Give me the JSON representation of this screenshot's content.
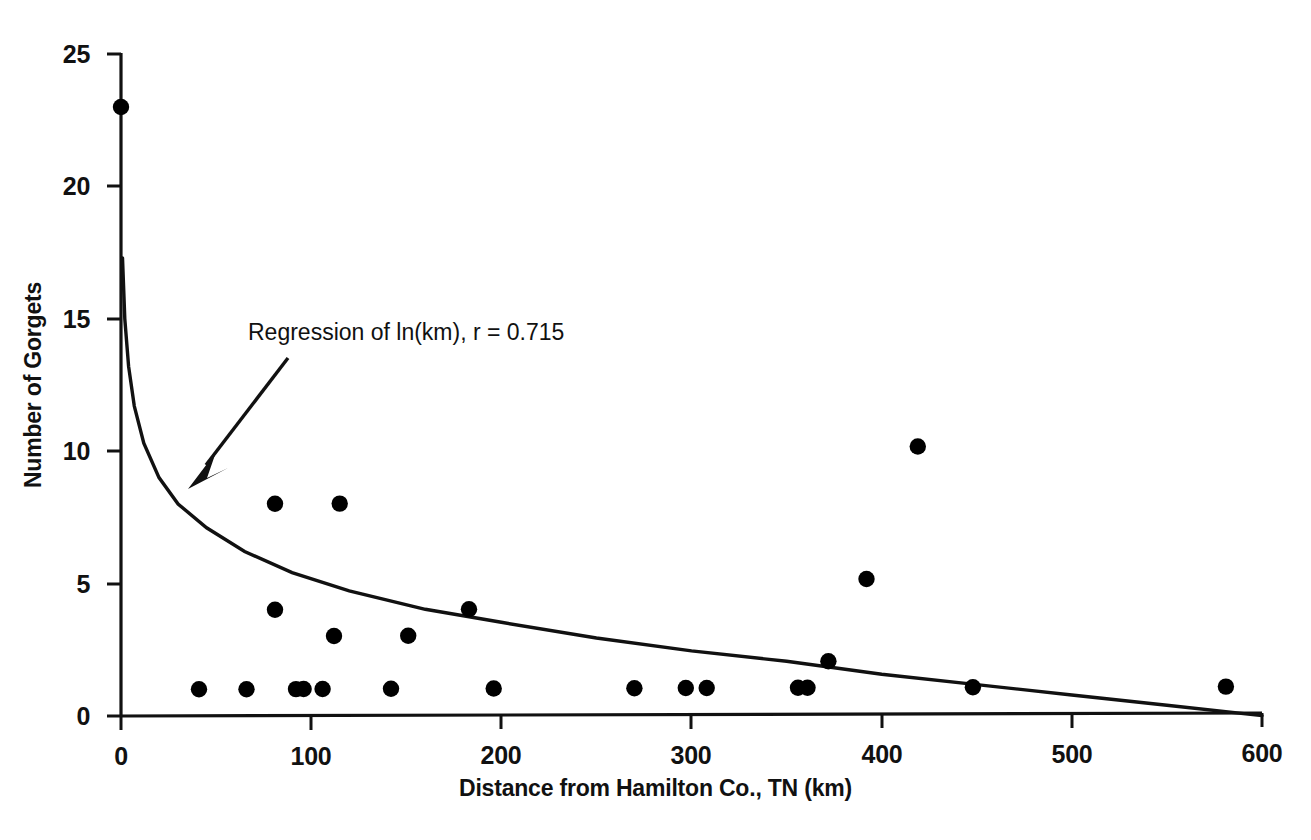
{
  "chart_data": {
    "type": "scatter",
    "title": "",
    "xlabel": "Distance from Hamilton Co., TN (km)",
    "ylabel": "Number of Gorgets",
    "xlim": [
      0,
      600
    ],
    "ylim": [
      0,
      25
    ],
    "xticks": [
      0,
      100,
      200,
      300,
      400,
      500,
      600
    ],
    "yticks": [
      0,
      5,
      10,
      15,
      20,
      25
    ],
    "grid": false,
    "legend": "none",
    "annotations": [
      {
        "text": "Regression of ln(km), r = 0.715",
        "points_to": "regression-curve",
        "arrow": true
      }
    ],
    "series": [
      {
        "name": "Gorget counts by distance",
        "marker": "filled-circle",
        "color": "#000000",
        "points": [
          {
            "x": 0,
            "y": 23
          },
          {
            "x": 41,
            "y": 1
          },
          {
            "x": 66,
            "y": 1
          },
          {
            "x": 81,
            "y": 8
          },
          {
            "x": 81,
            "y": 4
          },
          {
            "x": 92,
            "y": 1
          },
          {
            "x": 96,
            "y": 1
          },
          {
            "x": 106,
            "y": 1
          },
          {
            "x": 112,
            "y": 3
          },
          {
            "x": 115,
            "y": 8
          },
          {
            "x": 142,
            "y": 1
          },
          {
            "x": 151,
            "y": 3
          },
          {
            "x": 183,
            "y": 4
          },
          {
            "x": 196,
            "y": 1
          },
          {
            "x": 270,
            "y": 1
          },
          {
            "x": 297,
            "y": 1
          },
          {
            "x": 308,
            "y": 1
          },
          {
            "x": 356,
            "y": 1
          },
          {
            "x": 361,
            "y": 1
          },
          {
            "x": 372,
            "y": 2
          },
          {
            "x": 392,
            "y": 5.1
          },
          {
            "x": 419,
            "y": 10.1
          },
          {
            "x": 448,
            "y": 1
          },
          {
            "x": 581,
            "y": 1
          }
        ]
      },
      {
        "name": "Regression of ln(km)",
        "type": "line",
        "color": "#000000",
        "model": "y = a - b*ln(x)",
        "r": 0.715,
        "fit_points": [
          {
            "x": 0.8,
            "y": 17.3
          },
          {
            "x": 2,
            "y": 15.0
          },
          {
            "x": 4,
            "y": 13.2
          },
          {
            "x": 7,
            "y": 11.7
          },
          {
            "x": 12,
            "y": 10.3
          },
          {
            "x": 20,
            "y": 9.0
          },
          {
            "x": 30,
            "y": 8.0
          },
          {
            "x": 45,
            "y": 7.1
          },
          {
            "x": 65,
            "y": 6.2
          },
          {
            "x": 90,
            "y": 5.4
          },
          {
            "x": 120,
            "y": 4.7
          },
          {
            "x": 160,
            "y": 4.0
          },
          {
            "x": 200,
            "y": 3.5
          },
          {
            "x": 250,
            "y": 2.9
          },
          {
            "x": 300,
            "y": 2.4
          },
          {
            "x": 350,
            "y": 2.0
          },
          {
            "x": 400,
            "y": 1.5
          },
          {
            "x": 450,
            "y": 1.1
          },
          {
            "x": 500,
            "y": 0.7
          },
          {
            "x": 550,
            "y": 0.3
          },
          {
            "x": 600,
            "y": -0.1
          }
        ]
      }
    ]
  },
  "axes": {
    "x_title": "Distance from Hamilton Co., TN (km)",
    "y_title": "Number of Gorgets",
    "x_tick_labels": [
      "0",
      "100",
      "200",
      "300",
      "400",
      "500",
      "600"
    ],
    "y_tick_labels": [
      "0",
      "5",
      "10",
      "15",
      "20",
      "25"
    ]
  },
  "annotation": {
    "label": "Regression of ln(km), r = 0.715"
  },
  "colors": {
    "ink": "#111111",
    "marker": "#000000",
    "background": "#ffffff"
  }
}
